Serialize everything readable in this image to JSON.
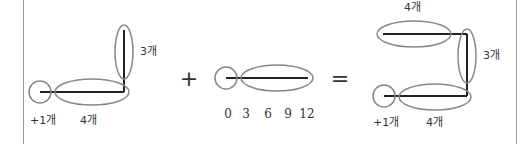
{
  "diagram": {
    "colors": {
      "line": "#222222",
      "ellipse": "#888888",
      "text": "#333333",
      "border": "#9a9a9a"
    },
    "left_figure": {
      "vertical_label": "3개",
      "horizontal_label": "4개",
      "circle_label": "+1개"
    },
    "plus_operator": "+",
    "middle_figure": {
      "tick_labels": [
        "0",
        "3",
        "6",
        "9",
        "12"
      ]
    },
    "equals_operator": "=",
    "right_figure": {
      "top_label": "4개",
      "vertical_label": "3개",
      "bottom_label": "4개",
      "circle_label": "+1개"
    }
  }
}
